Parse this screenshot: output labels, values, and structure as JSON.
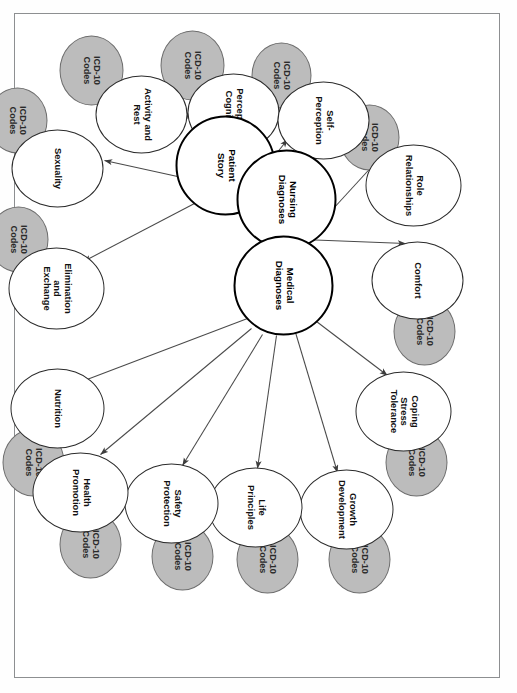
{
  "diagram": {
    "type": "concept-map",
    "orientation": "rotated-90-clockwise",
    "icd_label": "ICD-10\nCodes",
    "colors": {
      "gray_fill": "#bcbcbc",
      "gray_stroke": "#6d6d6d",
      "white_fill": "#ffffff",
      "node_stroke": "#2b2b2b",
      "core_stroke": "#000000",
      "edge_stroke": "#4a4a4a",
      "frame_stroke": "#8d8f91",
      "page_background": "#ffffff"
    },
    "core_nodes": [
      {
        "id": "patient-story",
        "label": "Patient\nStory",
        "cx": 152,
        "cy": 275,
        "r": 50
      },
      {
        "id": "nursing-diagnoses",
        "label": "Nursing\nDiagnoses",
        "cx": 186,
        "cy": 214,
        "r": 50
      },
      {
        "id": "medical-diagnoses",
        "label": "Medical\nDiagnoses",
        "cx": 272,
        "cy": 217,
        "r": 50
      }
    ],
    "domain_nodes": [
      {
        "id": "sexuality",
        "label": "Sexuality",
        "cx": 155,
        "cy": 443,
        "rx": 39,
        "ry": 46,
        "icd": true,
        "icd_cx": 107,
        "icd_cy": 483,
        "icd_rx": 33,
        "icd_ry": 30,
        "source": "nursing"
      },
      {
        "id": "activity-and-rest",
        "label": "Activity and\nRest",
        "cx": 101,
        "cy": 359,
        "rx": 39,
        "ry": 46,
        "icd": true,
        "icd_cx": 57,
        "icd_cy": 409,
        "icd_rx": 35,
        "icd_ry": 32,
        "source": "nursing"
      },
      {
        "id": "perception-cognition",
        "label": "Perception\nCognition",
        "cx": 99,
        "cy": 267,
        "rx": 39,
        "ry": 46,
        "icd": true,
        "icd_cx": 52,
        "icd_cy": 308,
        "icd_rx": 35,
        "icd_ry": 32,
        "source": "nursing"
      },
      {
        "id": "self-perception",
        "label": "Self-\nPerception",
        "cx": 107,
        "cy": 177,
        "rx": 39,
        "ry": 46,
        "icd": true,
        "icd_cx": 62,
        "icd_cy": 219,
        "icd_rx": 33,
        "icd_ry": 30,
        "source": "nursing"
      },
      {
        "id": "role-relationships",
        "label": "Role\nRelationships",
        "cx": 172,
        "cy": 87,
        "rx": 41,
        "ry": 48,
        "icd": true,
        "icd_cx": 124,
        "icd_cy": 131,
        "icd_rx": 33,
        "icd_ry": 30,
        "source": "nursing"
      },
      {
        "id": "comfort",
        "label": "Comfort",
        "cx": 267,
        "cy": 83,
        "rx": 39,
        "ry": 46,
        "icd": true,
        "icd_cx": 318,
        "icd_cy": 76,
        "icd_rx": 34,
        "icd_ry": 31,
        "source": "nursing"
      },
      {
        "id": "coping-stress-tolerance",
        "label": "Coping\nStress\nTolerance",
        "cx": 398,
        "cy": 97,
        "rx": 40,
        "ry": 48,
        "icd": true,
        "icd_cx": 449,
        "icd_cy": 84,
        "icd_rx": 34,
        "icd_ry": 31,
        "source": "medical"
      },
      {
        "id": "growth-development",
        "label": "Growth\nDevelopment",
        "cx": 496,
        "cy": 154,
        "rx": 40,
        "ry": 47,
        "icd": true,
        "icd_cx": 546,
        "icd_cy": 141,
        "icd_rx": 34,
        "icd_ry": 31,
        "source": "medical"
      },
      {
        "id": "life-principles",
        "label": "Life\nPrinciples",
        "cx": 494,
        "cy": 245,
        "rx": 40,
        "ry": 47,
        "icd": true,
        "icd_cx": 546,
        "icd_cy": 233,
        "icd_rx": 34,
        "icd_ry": 31,
        "source": "medical"
      },
      {
        "id": "safety-protection",
        "label": "Safety\nProtection",
        "cx": 490,
        "cy": 329,
        "rx": 40,
        "ry": 47,
        "icd": true,
        "icd_cx": 543,
        "icd_cy": 318,
        "icd_rx": 34,
        "icd_ry": 31,
        "source": "medical"
      },
      {
        "id": "health-promotion",
        "label": "Health\nPromotion",
        "cx": 479,
        "cy": 420,
        "rx": 40,
        "ry": 48,
        "icd": true,
        "icd_cx": 531,
        "icd_cy": 410,
        "icd_rx": 34,
        "icd_ry": 31,
        "source": "medical"
      },
      {
        "id": "nutrition",
        "label": "Nutrition",
        "cx": 395,
        "cy": 443,
        "rx": 40,
        "ry": 47,
        "icd": true,
        "icd_cx": 449,
        "icd_cy": 467,
        "icd_rx": 34,
        "icd_ry": 31,
        "source": "medical"
      },
      {
        "id": "elimination-exchange",
        "label": "Elimination\nand\nExchange",
        "cx": 275,
        "cy": 444,
        "rx": 41,
        "ry": 48,
        "icd": true,
        "icd_cx": 226,
        "icd_cy": 482,
        "icd_rx": 33,
        "icd_ry": 30,
        "source": "patient"
      }
    ],
    "edges": [
      {
        "from": "nursing-diagnoses",
        "to": "sexuality",
        "x1": 177,
        "y1": 259,
        "x2": 147,
        "y2": 396
      },
      {
        "from": "nursing-diagnoses",
        "to": "activity-and-rest",
        "x1": 168,
        "y1": 260,
        "x2": 98,
        "y2": 315
      },
      {
        "from": "nursing-diagnoses",
        "to": "perception-cognition",
        "x1": 175,
        "y1": 261,
        "x2": 104,
        "y2": 223
      },
      {
        "from": "nursing-diagnoses",
        "to": "self-perception",
        "x1": 191,
        "y1": 264,
        "x2": 126,
        "y2": 213
      },
      {
        "from": "nursing-diagnoses",
        "to": "role-relationships",
        "x1": 220,
        "y1": 190,
        "x2": 136,
        "y2": 113
      },
      {
        "from": "nursing-diagnoses",
        "to": "comfort",
        "x1": 226,
        "y1": 198,
        "x2": 230,
        "y2": 95
      },
      {
        "from": "patient-story",
        "to": "elimination-exchange",
        "x1": 190,
        "y1": 306,
        "x2": 248,
        "y2": 417
      },
      {
        "from": "medical-diagnoses",
        "to": "nutrition",
        "x1": 305,
        "y1": 253,
        "x2": 370,
        "y2": 424
      },
      {
        "from": "medical-diagnoses",
        "to": "health-promotion",
        "x1": 315,
        "y1": 249,
        "x2": 441,
        "y2": 400
      },
      {
        "from": "medical-diagnoses",
        "to": "safety-protection",
        "x1": 321,
        "y1": 238,
        "x2": 452,
        "y2": 318
      },
      {
        "from": "medical-diagnoses",
        "to": "life-principles",
        "x1": 322,
        "y1": 224,
        "x2": 455,
        "y2": 243
      },
      {
        "from": "medical-diagnoses",
        "to": "growth-development",
        "x1": 319,
        "y1": 205,
        "x2": 459,
        "y2": 163
      },
      {
        "from": "medical-diagnoses",
        "to": "coping-stress-tolerance",
        "x1": 308,
        "y1": 184,
        "x2": 362,
        "y2": 113
      }
    ]
  }
}
